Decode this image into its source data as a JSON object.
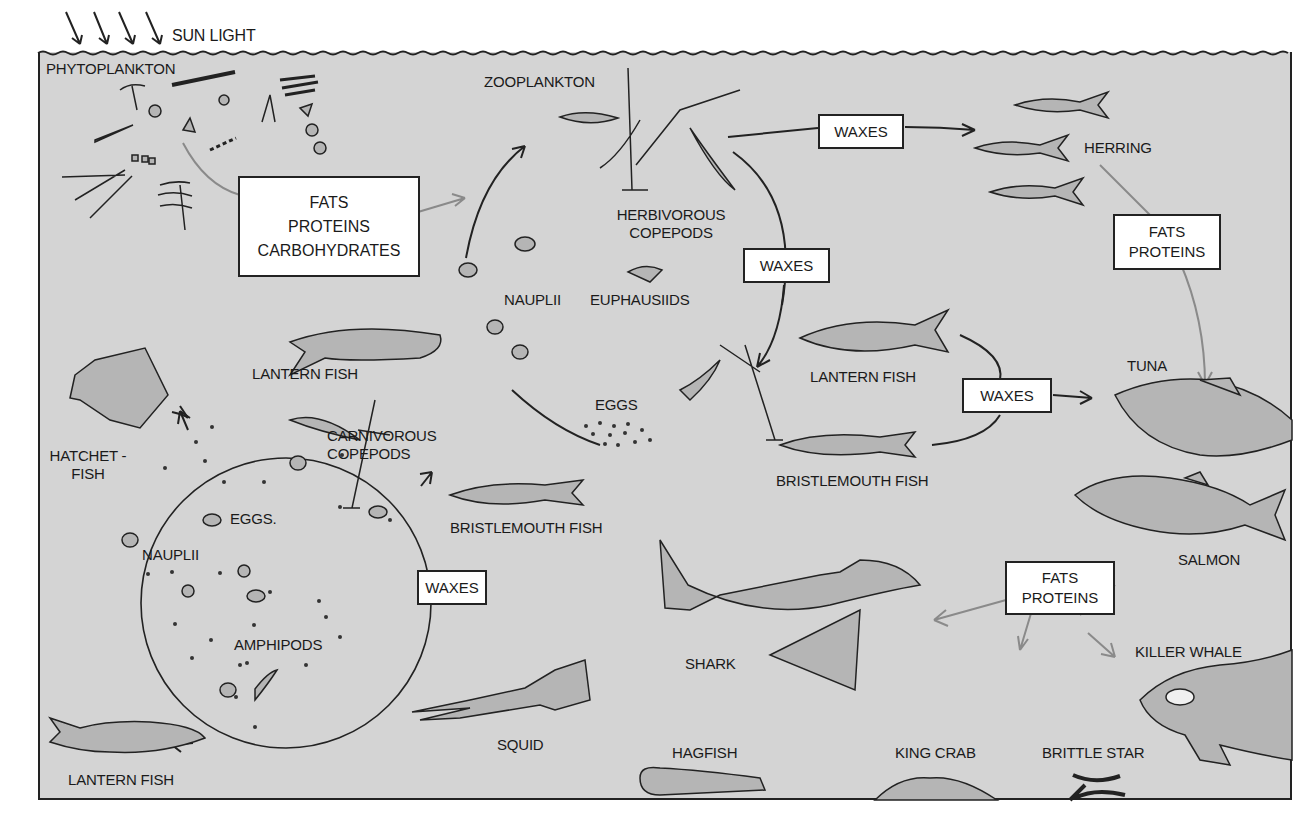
{
  "diagram": {
    "type": "marine-food-web",
    "colors": {
      "water": "#d4d4d4",
      "frame": "#222222",
      "box_fill": "#ffffff",
      "primary_arrow": "#222222",
      "secondary_arrow": "#8a8a8a"
    },
    "surface": {
      "sunlight_label": "SUN LIGHT",
      "sun_arrow_count": 4
    },
    "labels": {
      "phytoplankton": "PHYTOPLANKTON",
      "zooplankton": "ZOOPLANKTON",
      "herbivorous_copepods": [
        "HERBIVOROUS",
        "COPEPODS"
      ],
      "nauplii_top": "NAUPLII",
      "euphausiids": "EUPHAUSIIDS",
      "eggs_top": "EGGS",
      "lantern_fish_mid": "LANTERN FISH",
      "lantern_fish_right": "LANTERN FISH",
      "lantern_fish_bottom": "LANTERN FISH",
      "herring": "HERRING",
      "tuna": "TUNA",
      "bristlemouth_right": "BRISTLEMOUTH FISH",
      "bristlemouth_mid": "BRISTLEMOUTH FISH",
      "hatchetfish": [
        "HATCHET -",
        "FISH"
      ],
      "carnivorous_copepods": [
        "CARNIVOROUS",
        "COPEPODS"
      ],
      "eggs_bottom": "EGGS.",
      "nauplii_bottom": "NAUPLII",
      "amphipods": "AMPHIPODS",
      "salmon": "SALMON",
      "shark": "SHARK",
      "killer_whale": "KILLER WHALE",
      "squid": "SQUID",
      "hagfish": "HAGFISH",
      "king_crab": "KING CRAB",
      "brittle_star": "BRITTLE STAR"
    },
    "boxes": {
      "phyto_nutrients": [
        "FATS",
        "PROTEINS",
        "CARBOHYDRATES"
      ],
      "waxes_to_herring": "WAXES",
      "waxes_copepod_cycle": "WAXES",
      "herring_to_tuna": [
        "FATS",
        "PROTEINS"
      ],
      "waxes_to_tuna": "WAXES",
      "waxes_deep_cycle": "WAXES",
      "salmon_to_predators": [
        "FATS",
        "PROTEINS"
      ]
    },
    "flows": [
      {
        "from": "PHYTOPLANKTON",
        "to": "ZOOPLANKTON",
        "via": "FATS PROTEINS CARBOHYDRATES"
      },
      {
        "from": "HERBIVOROUS COPEPODS",
        "to": "HERRING",
        "via": "WAXES"
      },
      {
        "from": "HERBIVOROUS COPEPODS",
        "to": "CARNIVOROUS COPEPODS / LANTERN FISH / BRISTLEMOUTH FISH",
        "via": "WAXES"
      },
      {
        "from": "HERRING",
        "to": "TUNA",
        "via": "FATS PROTEINS"
      },
      {
        "from": "LANTERN FISH / BRISTLEMOUTH FISH",
        "to": "TUNA",
        "via": "WAXES"
      },
      {
        "from": "NAUPLII / EGGS / AMPHIPODS",
        "to": "HATCHETFISH / CARNIVOROUS COPEPODS / LANTERN FISH",
        "via": "WAXES"
      },
      {
        "from": "SALMON",
        "to": "SHARK / KILLER WHALE / BENTHOS",
        "via": "FATS PROTEINS"
      }
    ]
  }
}
